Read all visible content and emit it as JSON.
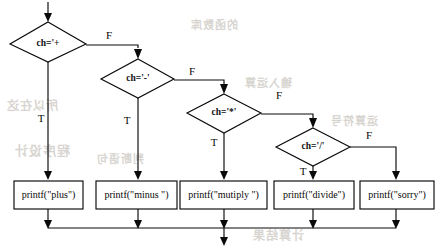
{
  "diagram": {
    "type": "flowchart",
    "entry": {
      "label": "",
      "arrow": "down"
    },
    "decisions": [
      {
        "id": "d1",
        "label": "ch='+",
        "true_label": "T",
        "false_label": "F",
        "true_target": "p1",
        "false_target": "d2"
      },
      {
        "id": "d2",
        "label": "ch='-'",
        "true_label": "T",
        "false_label": "F",
        "true_target": "p2",
        "false_target": "d3"
      },
      {
        "id": "d3",
        "label": "ch='*'",
        "true_label": "T",
        "false_label": "F",
        "true_target": "p3",
        "false_target": "d4"
      },
      {
        "id": "d4",
        "label": "ch='/'",
        "true_label": "T",
        "false_label": "F",
        "true_target": "p4",
        "false_target": "p5"
      }
    ],
    "processes": [
      {
        "id": "p1",
        "label": "printf(\"plus\")"
      },
      {
        "id": "p2",
        "label": "printf(\"minus \")"
      },
      {
        "id": "p3",
        "label": "printf(\"mutiply \")"
      },
      {
        "id": "p4",
        "label": "printf(\"divide\")"
      },
      {
        "id": "p5",
        "label": "printf(\"sorry\")"
      }
    ],
    "merge": {
      "label": "",
      "exit_arrow": "down"
    },
    "colors": {
      "stroke": "#0a0a0a",
      "fill": "#ffffff",
      "background": "#ffffff",
      "text": "#080808",
      "bleed": "#b9b4ac"
    }
  },
  "artifacts": {
    "bleed_text": [
      "所以在这",
      "程序设计",
      "的函数库",
      "输入运算",
      "计算结果",
      "判断语句",
      "运算符号"
    ]
  }
}
